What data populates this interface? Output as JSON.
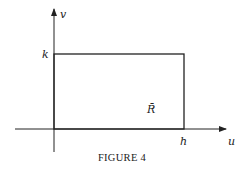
{
  "figure": {
    "caption": "FIGURE 4",
    "axes": {
      "horizontal_label": "u",
      "vertical_label": "v"
    },
    "ticks": {
      "h_label": "h",
      "k_label": "k"
    },
    "region_label": "R̄",
    "colors": {
      "stroke": "#222222",
      "background": "#ffffff"
    }
  }
}
